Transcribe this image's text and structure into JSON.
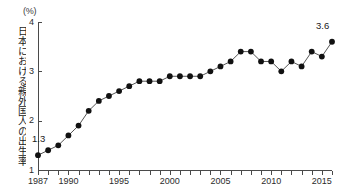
{
  "chart_data": {
    "type": "line",
    "title": "",
    "subtitle": "",
    "unit_label": "(%)",
    "xlabel": "",
    "ylabel": "日本における親外国人の出生率",
    "xlim": [
      1987,
      2016
    ],
    "ylim": [
      1,
      4
    ],
    "yticks": [
      1,
      2,
      3,
      4
    ],
    "ytick_labels": [
      "1",
      "2",
      "3",
      "4"
    ],
    "xticks": [
      1987,
      1988,
      1989,
      1990,
      1991,
      1992,
      1993,
      1994,
      1995,
      1996,
      1997,
      1998,
      1999,
      2000,
      2001,
      2002,
      2003,
      2004,
      2005,
      2006,
      2007,
      2008,
      2009,
      2010,
      2011,
      2012,
      2013,
      2014,
      2015,
      2016
    ],
    "xtick_labels": [
      {
        "year": 1987,
        "label": "1987"
      },
      {
        "year": 1990,
        "label": "1990"
      },
      {
        "year": 1995,
        "label": "1995"
      },
      {
        "year": 2000,
        "label": "2000"
      },
      {
        "year": 2005,
        "label": "2005"
      },
      {
        "year": 2010,
        "label": "2010"
      },
      {
        "year": 2015,
        "label": "2015"
      }
    ],
    "grid": false,
    "legend": false,
    "marker": "filled-circle",
    "line_color": "#555555",
    "marker_color": "#111111",
    "x": [
      1987,
      1988,
      1989,
      1990,
      1991,
      1992,
      1993,
      1994,
      1995,
      1996,
      1997,
      1998,
      1999,
      2000,
      2001,
      2002,
      2003,
      2004,
      2005,
      2006,
      2007,
      2008,
      2009,
      2010,
      2011,
      2012,
      2013,
      2014,
      2015,
      2016
    ],
    "values": [
      1.3,
      1.4,
      1.5,
      1.7,
      1.9,
      2.2,
      2.4,
      2.5,
      2.6,
      2.7,
      2.8,
      2.8,
      2.8,
      2.9,
      2.9,
      2.9,
      2.9,
      3.0,
      3.1,
      3.2,
      3.4,
      3.4,
      3.2,
      3.2,
      3.0,
      3.2,
      3.1,
      3.4,
      3.3,
      3.6
    ],
    "annotations": [
      {
        "name": "first-point-label",
        "text": "1.3",
        "year": 1987,
        "value": 1.3
      },
      {
        "name": "last-point-label",
        "text": "3.6",
        "year": 2016,
        "value": 3.6
      }
    ]
  }
}
